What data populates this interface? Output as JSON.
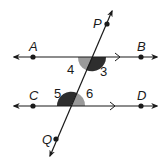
{
  "diagram": {
    "colors": {
      "line": "#1a1a1a",
      "angle_dark": "#2e2e2e",
      "angle_light": "#9a9a9a",
      "background": "#ffffff"
    },
    "lines": [
      {
        "id": "AB",
        "points": [
          "A",
          "B"
        ],
        "parallel_mark": true
      },
      {
        "id": "CD",
        "points": [
          "C",
          "D"
        ],
        "parallel_mark": true
      },
      {
        "id": "PQ",
        "points": [
          "P",
          "Q"
        ],
        "role": "transversal"
      }
    ],
    "points": {
      "A": {
        "label": "A"
      },
      "B": {
        "label": "B"
      },
      "C": {
        "label": "C"
      },
      "D": {
        "label": "D"
      },
      "P": {
        "label": "P"
      },
      "Q": {
        "label": "Q"
      }
    },
    "angles": [
      {
        "label": "3",
        "shade": "dark"
      },
      {
        "label": "4",
        "shade": "light"
      },
      {
        "label": "5",
        "shade": "dark"
      },
      {
        "label": "6",
        "shade": "light"
      }
    ]
  }
}
